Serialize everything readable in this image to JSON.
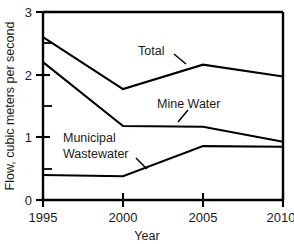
{
  "chart_data": {
    "type": "line",
    "title": "",
    "xlabel": "Year",
    "ylabel": "Flow, cubic meters per second",
    "x": [
      1995,
      2000,
      2005,
      2010
    ],
    "xticklabels": [
      "1995",
      "2000",
      "2005",
      "2010"
    ],
    "yticklabels": [
      "0",
      "1",
      "2",
      "3"
    ],
    "ytickvalues": [
      0,
      1,
      2,
      3
    ],
    "yminorticks": [
      0.5,
      1.5,
      2.5
    ],
    "xlim": [
      1995,
      2010
    ],
    "ylim": [
      0,
      3
    ],
    "grid": false,
    "legend": "inline-annotations",
    "series": [
      {
        "name": "Total",
        "values": [
          2.6,
          1.77,
          2.16,
          1.97
        ]
      },
      {
        "name": "Mine Water",
        "values": [
          2.2,
          1.18,
          1.17,
          0.93
        ]
      },
      {
        "name": "Municipal Wastewater",
        "values": [
          0.4,
          0.38,
          0.86,
          0.85
        ]
      }
    ],
    "annotations": [
      {
        "text": "Total",
        "series": "Total"
      },
      {
        "text": "Mine Water",
        "series": "Mine Water"
      },
      {
        "text_line1": "Municipal",
        "text_line2": "Wastewater",
        "series": "Municipal Wastewater"
      }
    ]
  },
  "axes": {
    "y_title": "Flow, cubic meters per second",
    "x_title": "Year",
    "y_ticks": [
      "3",
      "2",
      "1",
      "0"
    ],
    "x_ticks": [
      "1995",
      "2000",
      "2005",
      "2010"
    ]
  },
  "labels": {
    "total": "Total",
    "mine_water": "Mine Water",
    "municipal_line1": "Municipal",
    "municipal_line2": "Wastewater"
  },
  "colors": {
    "line": "#000000",
    "background": "#ffffff",
    "text": "#1a1a1a"
  }
}
